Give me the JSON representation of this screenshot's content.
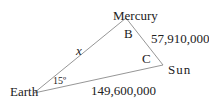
{
  "diagram": {
    "type": "triangle",
    "vertices": {
      "mercury": {
        "label": "Mercury"
      },
      "sun": {
        "label": "Sun"
      },
      "earth": {
        "label": "Earth"
      }
    },
    "angles": {
      "mercury": "B",
      "sun": "C",
      "earth": "15º"
    },
    "sides": {
      "earth_mercury": "x",
      "mercury_sun": "57,910,000",
      "earth_sun": "149,600,000"
    },
    "colors": {
      "line": "#8a8a8a",
      "text": "#222222",
      "background": "#ffffff"
    }
  }
}
